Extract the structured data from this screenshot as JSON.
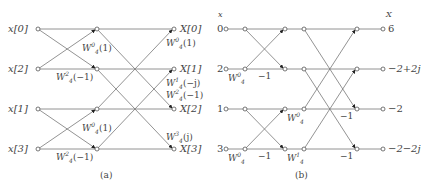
{
  "figure_a": {
    "caption": "(a)",
    "inputs": [
      "x[0]",
      "x[2]",
      "x[1]",
      "x[3]"
    ],
    "outputs": [
      "X[0]",
      "X[1]",
      "X[2]",
      "X[3]"
    ],
    "stage1_twiddles": [
      {
        "base": "W",
        "sup": "0",
        "sub": "4",
        "arg": "(1)"
      },
      {
        "base": "W",
        "sup": "2",
        "sub": "4",
        "arg": "(−1)"
      },
      {
        "base": "W",
        "sup": "0",
        "sub": "4",
        "arg": "(1)"
      },
      {
        "base": "W",
        "sup": "2",
        "sub": "4",
        "arg": "(−1)"
      }
    ],
    "stage2_twiddles": [
      {
        "base": "W",
        "sup": "0",
        "sub": "4",
        "arg": "(1)"
      },
      {
        "base": "W",
        "sup": "1",
        "sub": "4",
        "arg": "(−j)"
      },
      {
        "base": "W",
        "sup": "2",
        "sub": "4",
        "arg": "(−1)"
      },
      {
        "base": "W",
        "sup": "3",
        "sub": "4",
        "arg": "(j)"
      }
    ]
  },
  "figure_b": {
    "caption": "(b)",
    "input_header": "x",
    "output_header": "X",
    "inputs": [
      "0",
      "2",
      "1",
      "3"
    ],
    "outputs": [
      "6",
      "−2+2j",
      "−2",
      "−2−2j"
    ],
    "stage1_twiddles": [
      {
        "base": "W",
        "sup": "0",
        "sub": "4"
      },
      {
        "base": "W",
        "sup": "0",
        "sub": "4"
      }
    ],
    "stage2_twiddles": [
      {
        "base": "W",
        "sup": "0",
        "sub": "4"
      },
      {
        "base": "W",
        "sup": "1",
        "sub": "4"
      }
    ],
    "minus_one_labels": [
      "−1",
      "−1",
      "−1",
      "−1"
    ]
  }
}
